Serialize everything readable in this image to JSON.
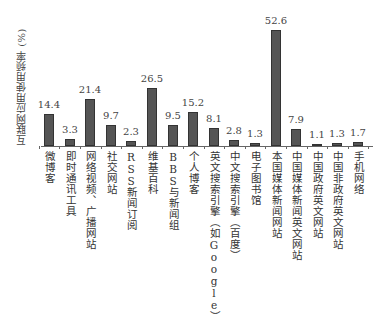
{
  "chart_data": {
    "type": "bar",
    "title": "",
    "xlabel": "",
    "ylabel": "互联网应用使用频率 (%)",
    "ylim": [
      0,
      55
    ],
    "grid": false,
    "legend": null,
    "categories": [
      "微博客",
      "即时通讯工具",
      "网络视频、广播网站",
      "社交网站",
      "RSS新闻订阅",
      "维基百科",
      "BBS与新闻组",
      "个人博客",
      "英文搜索引擎（如Google）",
      "中文搜索引擎（百度）",
      "电子图书馆",
      "本国媒体新闻网站",
      "中国媒体新闻英文网站",
      "中国政府英文网站",
      "中国非政府英文网站",
      "手机网络"
    ],
    "values": [
      14.4,
      3.3,
      21.4,
      9.7,
      2.3,
      26.5,
      9.5,
      15.2,
      8.1,
      2.8,
      1.3,
      52.6,
      7.9,
      1.1,
      1.3,
      1.7
    ],
    "value_labels": [
      "14.4",
      "3.3",
      "21.4",
      "9.7",
      "2.3",
      "26.5",
      "9.5",
      "15.2",
      "8.1",
      "2.8",
      "1.3",
      "52.6",
      "7.9",
      "1.1",
      "1.3",
      "1.7"
    ],
    "bar_color": "#555555"
  }
}
